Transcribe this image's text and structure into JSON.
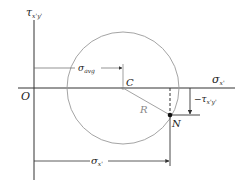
{
  "labels": {
    "tau_axis": "τ",
    "tau_axis_sub": "x'y'",
    "sigma_axis": "σ",
    "sigma_axis_sub": "x'",
    "origin": "O",
    "center": "C",
    "radius": "R",
    "point": "N",
    "sigma_avg": "σ",
    "sigma_avg_sub": "avg",
    "sigma_x": "σ",
    "sigma_x_sub": "x'",
    "neg_tau": "−τ",
    "neg_tau_sub": "x'y'"
  },
  "geometry": {
    "origin": [
      34,
      88
    ],
    "center": [
      123,
      88
    ],
    "radius": 56,
    "point_N": [
      170,
      115
    ]
  },
  "colors": {
    "axis": "#333333",
    "circle": "#9a9a9a",
    "text": "#222222",
    "radius_label": "#888888"
  }
}
